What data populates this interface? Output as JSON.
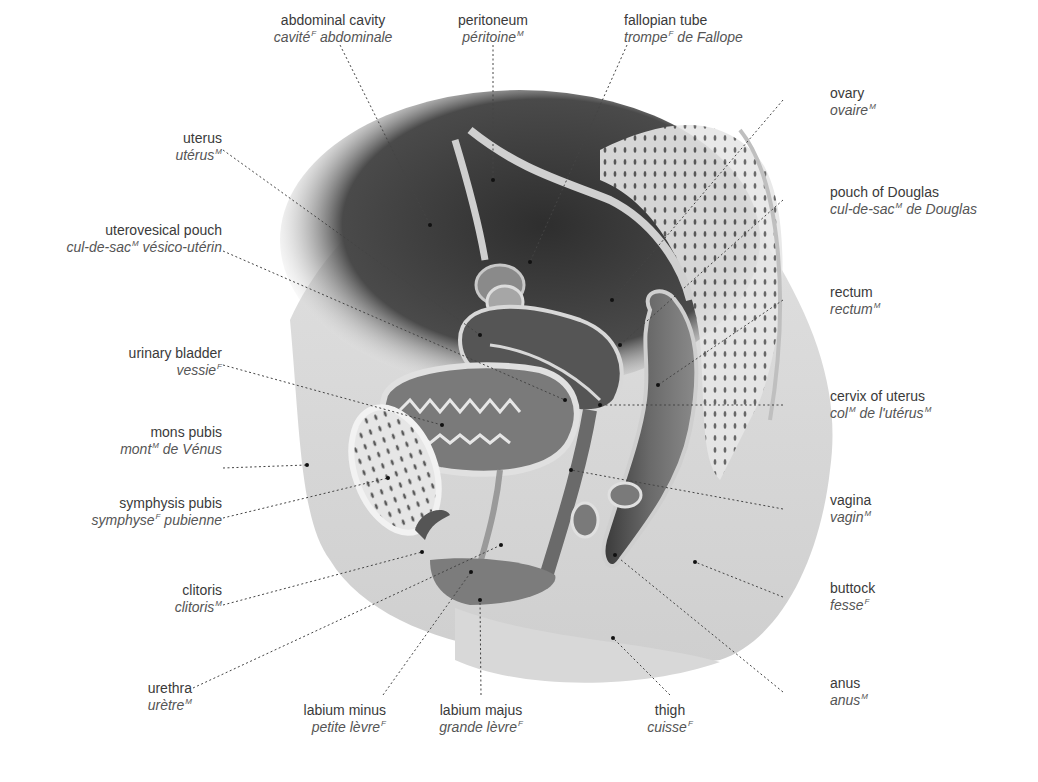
{
  "figure": {
    "colors": {
      "background": "#ffffff",
      "text_en": "#3a3a3a",
      "text_fr": "#555555",
      "leader_line": "#444444",
      "cavity_dark": "#3c3c3c",
      "tissue_light": "#d4d4d4",
      "organ_mid": "#8a8a8a"
    }
  },
  "labels": [
    {
      "id": "abdominal-cavity",
      "en": "abdominal cavity",
      "fr": "cavité",
      "fr_gender": "F",
      "fr_suffix": " abdominale"
    },
    {
      "id": "peritoneum",
      "en": "peritoneum",
      "fr": "péritoine",
      "fr_gender": "M",
      "fr_suffix": ""
    },
    {
      "id": "fallopian-tube",
      "en": "fallopian tube",
      "fr": "trompe",
      "fr_gender": "F",
      "fr_suffix": " de Fallope"
    },
    {
      "id": "ovary",
      "en": "ovary",
      "fr": "ovaire",
      "fr_gender": "M",
      "fr_suffix": ""
    },
    {
      "id": "uterus",
      "en": "uterus",
      "fr": "utérus",
      "fr_gender": "M",
      "fr_suffix": ""
    },
    {
      "id": "uterovesical-pouch",
      "en": "uterovesical pouch",
      "fr": "cul-de-sac",
      "fr_gender": "M",
      "fr_suffix": " vésico-utérin"
    },
    {
      "id": "pouch-of-douglas",
      "en": "pouch of Douglas",
      "fr": "cul-de-sac",
      "fr_gender": "M",
      "fr_suffix": " de Douglas"
    },
    {
      "id": "urinary-bladder",
      "en": "urinary bladder",
      "fr": "vessie",
      "fr_gender": "F",
      "fr_suffix": ""
    },
    {
      "id": "rectum",
      "en": "rectum",
      "fr": "rectum",
      "fr_gender": "M",
      "fr_suffix": ""
    },
    {
      "id": "cervix-of-uterus",
      "en": "cervix of uterus",
      "fr": "col",
      "fr_gender": "M",
      "fr_suffix": " de l'utérus",
      "fr_gender2": "M"
    },
    {
      "id": "mons-pubis",
      "en": "mons pubis",
      "fr": "mont",
      "fr_gender": "M",
      "fr_suffix": " de Vénus"
    },
    {
      "id": "symphysis-pubis",
      "en": "symphysis pubis",
      "fr": "symphyse",
      "fr_gender": "F",
      "fr_suffix": " pubienne"
    },
    {
      "id": "vagina",
      "en": "vagina",
      "fr": "vagin",
      "fr_gender": "M",
      "fr_suffix": ""
    },
    {
      "id": "clitoris",
      "en": "clitoris",
      "fr": "clitoris",
      "fr_gender": "M",
      "fr_suffix": ""
    },
    {
      "id": "buttock",
      "en": "buttock",
      "fr": "fesse",
      "fr_gender": "F",
      "fr_suffix": ""
    },
    {
      "id": "urethra",
      "en": "urethra",
      "fr": "urètre",
      "fr_gender": "M",
      "fr_suffix": ""
    },
    {
      "id": "labium-minus",
      "en": "labium minus",
      "fr": "petite lèvre",
      "fr_gender": "F",
      "fr_suffix": ""
    },
    {
      "id": "labium-majus",
      "en": "labium majus",
      "fr": "grande lèvre",
      "fr_gender": "F",
      "fr_suffix": ""
    },
    {
      "id": "thigh",
      "en": "thigh",
      "fr": "cuisse",
      "fr_gender": "F",
      "fr_suffix": ""
    },
    {
      "id": "anus",
      "en": "anus",
      "fr": "anus",
      "fr_gender": "M",
      "fr_suffix": ""
    }
  ]
}
